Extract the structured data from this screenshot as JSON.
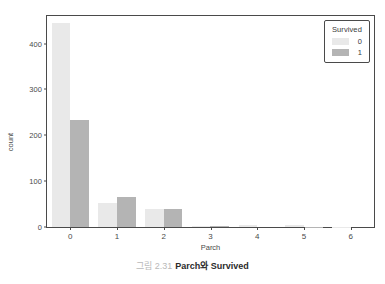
{
  "chart_data": {
    "type": "bar",
    "title": "",
    "xlabel": "Parch",
    "ylabel": "count",
    "categories": [
      "0",
      "1",
      "2",
      "3",
      "4",
      "5",
      "6"
    ],
    "series": [
      {
        "name": "0",
        "color": "#e9e9e9",
        "values": [
          445,
          53,
          40,
          2,
          4,
          4,
          1
        ]
      },
      {
        "name": "1",
        "color": "#b4b4b4",
        "values": [
          233,
          65,
          40,
          3,
          0,
          1,
          0
        ]
      }
    ],
    "ylim": [
      0,
      460
    ],
    "yticks": [
      0,
      100,
      200,
      300,
      400
    ],
    "ytick_labels": [
      "0",
      "100",
      "200",
      "300",
      "400"
    ],
    "xtick_labels": [
      "0",
      "1",
      "2",
      "3",
      "4",
      "5",
      "6"
    ],
    "grid": false,
    "legend": {
      "title": "Survived",
      "position": "upper-right",
      "entries": [
        "0",
        "1"
      ]
    }
  },
  "legend": {
    "title": "Survived",
    "items": [
      {
        "label": "0",
        "color": "#e9e9e9"
      },
      {
        "label": "1",
        "color": "#b4b4b4"
      }
    ]
  },
  "axes": {
    "ylabel": "count",
    "xlabel": "Parch",
    "yticks": [
      "0",
      "100",
      "200",
      "300",
      "400"
    ],
    "xticks": [
      "0",
      "1",
      "2",
      "3",
      "4",
      "5",
      "6"
    ]
  },
  "caption": {
    "number": "그림 2.31",
    "text": "Parch와 Survived"
  }
}
